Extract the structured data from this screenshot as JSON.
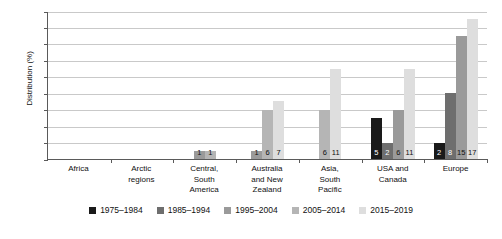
{
  "chart_data": {
    "type": "bar",
    "title": "",
    "xlabel": "",
    "ylabel": "Distribution (%)",
    "ylim": [
      0,
      18
    ],
    "yticks": [
      0,
      2,
      4,
      6,
      8,
      10,
      12,
      14,
      16,
      18
    ],
    "grid": true,
    "legend_position": "bottom",
    "categories": [
      "Africa",
      "Arctic regions",
      "Central, South America",
      "Australia and New Zealand",
      "Asia, South Pacific",
      "USA and Canada",
      "Europe"
    ],
    "series": [
      {
        "name": "1975–1984",
        "color": "#1a1a1a",
        "values": [
          0,
          0,
          0,
          0,
          0,
          5,
          2
        ]
      },
      {
        "name": "1985–1994",
        "color": "#6e6e6e",
        "values": [
          0,
          0,
          0,
          0,
          0,
          2,
          8
        ]
      },
      {
        "name": "1995–2004",
        "color": "#9a9a9a",
        "values": [
          0,
          0,
          1,
          1,
          0,
          6,
          15
        ]
      },
      {
        "name": "2005–2014",
        "color": "#b5b5b5",
        "values": [
          0,
          0,
          1,
          6,
          6,
          0,
          0
        ]
      },
      {
        "name": "2015–2019",
        "color": "#dedede",
        "values": [
          0,
          0,
          0,
          7,
          11,
          11,
          17
        ]
      }
    ],
    "bar_labels": {
      "Africa": [],
      "Arctic regions": [],
      "Central, South America": [
        "1",
        "1"
      ],
      "Australia and New Zealand": [
        "1",
        "6",
        "7"
      ],
      "Asia, South Pacific": [
        "6",
        "11"
      ],
      "USA and Canada": [
        "5",
        "2",
        "6",
        "11"
      ],
      "Europe": [
        "2",
        "8",
        "15",
        "17"
      ]
    }
  },
  "axis": {
    "y_title": "Distribution (%)",
    "y_ticks": [
      "0",
      "2",
      "4",
      "6",
      "8",
      "10",
      "12",
      "14",
      "16",
      "18"
    ]
  },
  "categories": [
    {
      "label": "Africa",
      "lines": [
        "Africa"
      ]
    },
    {
      "label": "Arctic regions",
      "lines": [
        "Arctic",
        "regions"
      ]
    },
    {
      "label": "Central, South America",
      "lines": [
        "Central,",
        "South",
        "America"
      ]
    },
    {
      "label": "Australia and New Zealand",
      "lines": [
        "Australia",
        "and New",
        "Zealand"
      ]
    },
    {
      "label": "Asia, South Pacific",
      "lines": [
        "Asia,",
        "South",
        "Pacific"
      ]
    },
    {
      "label": "USA and Canada",
      "lines": [
        "USA and",
        "Canada"
      ]
    },
    {
      "label": "Europe",
      "lines": [
        "Europe"
      ]
    }
  ],
  "legend": {
    "items": [
      {
        "label": "1975–1984",
        "color": "#1a1a1a"
      },
      {
        "label": "1985–1994",
        "color": "#6e6e6e"
      },
      {
        "label": "1995–2004",
        "color": "#9a9a9a"
      },
      {
        "label": "2005–2014",
        "color": "#b5b5b5"
      },
      {
        "label": "2015–2019",
        "color": "#dedede"
      }
    ]
  }
}
